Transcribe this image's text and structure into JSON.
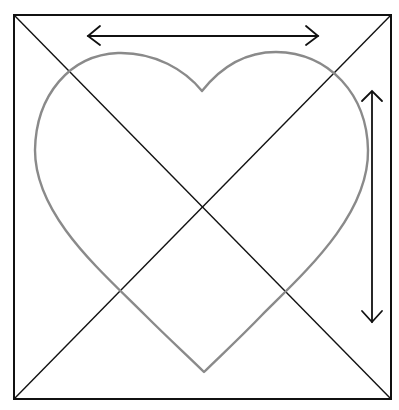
{
  "diagram": {
    "colors": {
      "background": "#ffffff",
      "frame": "#111111",
      "heart": "#8a8a8a",
      "arrows": "#111111"
    },
    "square": {
      "x": 14,
      "y": 15,
      "width": 377,
      "height": 384
    },
    "heart": {
      "notch": [
        202,
        91
      ],
      "tip": [
        204,
        372
      ],
      "left_extreme_x": 35,
      "right_extreme_x": 368,
      "lobe_top_y": 52
    },
    "arrows": {
      "horizontal": {
        "label": "width",
        "x1": 88,
        "x2": 318,
        "y": 36
      },
      "vertical": {
        "label": "height",
        "x": 372,
        "y1": 92,
        "y2": 322
      }
    }
  }
}
